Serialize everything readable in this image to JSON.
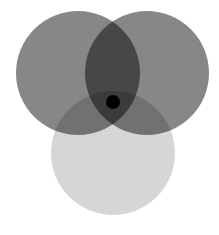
{
  "diagram": {
    "type": "venn",
    "background": "#ffffff",
    "circles": [
      {
        "id": "top-left",
        "cx": 78,
        "cy": 73,
        "r": 62,
        "color": "#000000",
        "opacity": 0.47
      },
      {
        "id": "top-right",
        "cx": 147,
        "cy": 73,
        "r": 62,
        "color": "#000000",
        "opacity": 0.47
      },
      {
        "id": "bottom",
        "cx": 113,
        "cy": 153,
        "r": 62,
        "color": "#000000",
        "opacity": 0.16
      }
    ],
    "center_dot": {
      "cx": 113,
      "cy": 102,
      "r": 7,
      "color": "#000000"
    },
    "region_colors": {
      "top_only": "#878787",
      "bottom_only": "#d6d6d6",
      "top_left_and_top_right": "#474747",
      "top_and_bottom": "#717171",
      "all_three": "#3c3c3c"
    }
  }
}
